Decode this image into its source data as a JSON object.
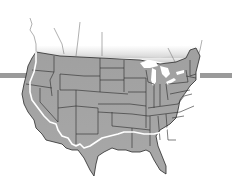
{
  "map": {
    "subject": "Contiguous United States",
    "style": "grayscale state-outline map",
    "colors": {
      "background": "#ffffff",
      "land": "#a8a8a8",
      "land_dark": "#8e8e8e",
      "state_border": "#2a2a2a",
      "route": "#ffffff",
      "side_bar": "#9a9a9a",
      "canada_fade": "#bdbdbd"
    },
    "route": {
      "description": "White route line following the Pacific coast south, then east along the southern border to the Atlantic coast"
    },
    "side_bars": [
      {
        "side": "left",
        "y": 75
      },
      {
        "side": "right",
        "y": 75
      }
    ]
  }
}
